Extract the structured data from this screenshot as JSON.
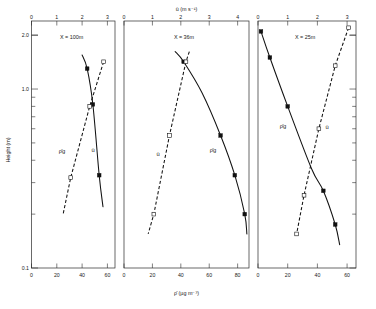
{
  "figure": {
    "ylabel": "Height (m)",
    "top_axis_title": "ū (m s⁻¹)",
    "bottom_axis_title": "ρ̄ (µg m⁻³)",
    "y_ticks": [
      "2.0",
      "1.0",
      "0.1"
    ],
    "series_label_rho": "ρ̄g",
    "series_label_u": "ū"
  },
  "chart_data": {
    "type": "line",
    "title": "",
    "subtitle": "",
    "xlabel": "ρ̄ (µg m⁻³)",
    "ylabel": "Height (m)",
    "top_xlabel": "ū (m s⁻¹)",
    "yscale": "log",
    "ylim": [
      0.1,
      2.4
    ],
    "y_tick_values": [
      2.0,
      1.0,
      0.1
    ],
    "y_tick_labels": [
      "2.0",
      "1.0",
      "0.1"
    ],
    "grid": false,
    "legend": "inline-curve-labels",
    "marker_styles": {
      "rho_g": "filled-square",
      "u": "open-square"
    },
    "line_styles": {
      "rho_g": "solid",
      "u": "dashed"
    },
    "panels": [
      {
        "name": "panel-1",
        "label": "X = 100m",
        "bottom_axis": {
          "label": "ρ̄ (µg m⁻³)",
          "ticks": [
            0,
            20,
            40,
            60
          ],
          "tick_labels": [
            "0",
            "20",
            "40",
            "60"
          ],
          "range": [
            0,
            66
          ]
        },
        "top_axis": {
          "label": "ū (m s⁻¹)",
          "ticks": [
            0,
            1,
            2,
            3
          ],
          "tick_labels": [
            "0",
            "1",
            "2",
            "3"
          ],
          "range": [
            0,
            3.3
          ]
        },
        "series": [
          {
            "name": "ρ̄g",
            "style": "solid",
            "marker": "filled-square",
            "axis": "bottom",
            "x": [
              40.0,
              44.0,
              48.5,
              53.5,
              56.5
            ],
            "y": [
              1.55,
              1.3,
              0.82,
              0.33,
              0.22
            ],
            "markers_at": [
              [
                44.0,
                1.3
              ],
              [
                48.5,
                0.82
              ],
              [
                53.5,
                0.33
              ]
            ]
          },
          {
            "name": "ū",
            "style": "dashed",
            "marker": "open-square",
            "axis": "top",
            "x": [
              2.85,
              2.3,
              1.55,
              1.25
            ],
            "y": [
              1.42,
              0.8,
              0.32,
              0.2
            ],
            "markers_at": [
              [
                2.85,
                1.42
              ],
              [
                2.3,
                0.8
              ],
              [
                1.55,
                0.32
              ]
            ]
          }
        ]
      },
      {
        "name": "panel-2",
        "label": "X = 36m",
        "bottom_axis": {
          "label": "ρ̄ (µg m⁻³)",
          "ticks": [
            0,
            20,
            40,
            60,
            80
          ],
          "tick_labels": [
            "0",
            "20",
            "40",
            "60",
            "80"
          ],
          "range": [
            0,
            88
          ]
        },
        "top_axis": {
          "label": "ū (m s⁻¹)",
          "ticks": [
            0,
            1,
            2,
            3,
            4
          ],
          "tick_labels": [
            "0",
            "1",
            "2",
            "3",
            "4"
          ],
          "range": [
            0,
            4.4
          ]
        },
        "series": [
          {
            "name": "ρ̄g",
            "style": "solid",
            "marker": "filled-square",
            "axis": "bottom",
            "x": [
              36.0,
              42.0,
              55.0,
              68.0,
              78.0,
              85.0,
              86.5
            ],
            "y": [
              1.62,
              1.42,
              0.95,
              0.55,
              0.33,
              0.2,
              0.155
            ],
            "markers_at": [
              [
                42.0,
                1.42
              ],
              [
                68.0,
                0.55
              ],
              [
                78.0,
                0.33
              ],
              [
                85.0,
                0.2
              ]
            ]
          },
          {
            "name": "ū",
            "style": "dashed",
            "marker": "open-square",
            "axis": "top",
            "x": [
              2.3,
              2.18,
              1.6,
              1.05,
              0.85
            ],
            "y": [
              1.62,
              1.42,
              0.55,
              0.2,
              0.155
            ],
            "markers_at": [
              [
                2.18,
                1.42
              ],
              [
                1.6,
                0.55
              ],
              [
                1.05,
                0.2
              ]
            ]
          }
        ]
      },
      {
        "name": "panel-3",
        "label": "X = 25m",
        "bottom_axis": {
          "label": "ρ̄ (µg m⁻³)",
          "ticks": [
            0,
            20,
            40,
            60
          ],
          "tick_labels": [
            "0",
            "20",
            "40",
            "60"
          ],
          "range": [
            0,
            66
          ]
        },
        "top_axis": {
          "label": "ū (m s⁻¹)",
          "ticks": [
            0,
            1,
            2,
            3
          ],
          "tick_labels": [
            "0",
            "1",
            "2",
            "3"
          ],
          "range": [
            0,
            3.3
          ]
        },
        "series": [
          {
            "name": "ρ̄g",
            "style": "solid",
            "marker": "filled-square",
            "axis": "bottom",
            "x": [
              2.0,
              8.0,
              20.0,
              36.0,
              44.0,
              52.0,
              55.0
            ],
            "y": [
              2.1,
              1.5,
              0.8,
              0.36,
              0.27,
              0.175,
              0.135
            ],
            "markers_at": [
              [
                2.0,
                2.1
              ],
              [
                8.0,
                1.5
              ],
              [
                20.0,
                0.8
              ],
              [
                44.0,
                0.27
              ],
              [
                52.0,
                0.175
              ]
            ]
          },
          {
            "name": "ū",
            "style": "dashed",
            "marker": "open-square",
            "axis": "top",
            "x": [
              3.05,
              2.6,
              2.05,
              1.55,
              1.3
            ],
            "y": [
              2.2,
              1.35,
              0.6,
              0.255,
              0.155
            ],
            "markers_at": [
              [
                3.05,
                2.2
              ],
              [
                2.6,
                1.35
              ],
              [
                2.05,
                0.6
              ],
              [
                1.55,
                0.255
              ],
              [
                1.3,
                0.155
              ]
            ]
          }
        ]
      }
    ]
  }
}
